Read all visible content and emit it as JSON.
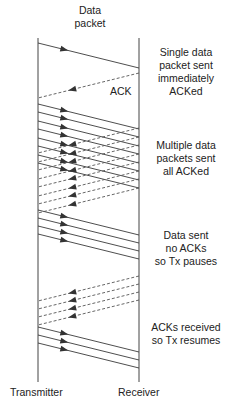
{
  "labels": {
    "data_packet_line1": "Data",
    "data_packet_line2": "packet",
    "ack": "ACK",
    "transmitter": "Transmitter",
    "receiver": "Receiver"
  },
  "annotations": {
    "single": [
      "Single data",
      "packet sent",
      "immediately",
      "ACKed"
    ],
    "multiple": [
      "Multiple data",
      "packets sent",
      "all ACKed"
    ],
    "pause": [
      "Data sent",
      "no ACKs",
      "so Tx pauses"
    ],
    "resume": [
      "ACKs received",
      "so Tx resumes"
    ]
  },
  "geometry": {
    "tx_x": 38,
    "rx_x": 139,
    "top_y": 38,
    "bottom_y": 382,
    "slope_px": 25,
    "data_packets_tx_y": [
      43,
      104,
      112,
      121,
      129,
      138,
      146,
      155,
      163,
      210,
      218,
      226,
      234,
      327,
      335,
      343
    ],
    "acks_rx_y": [
      73,
      128,
      137,
      145,
      154,
      162,
      171,
      179,
      188,
      276,
      284,
      292,
      300
    ]
  },
  "colors": {
    "line": "#3a3a3a",
    "ack_line": "#555555",
    "background": "#ffffff"
  }
}
